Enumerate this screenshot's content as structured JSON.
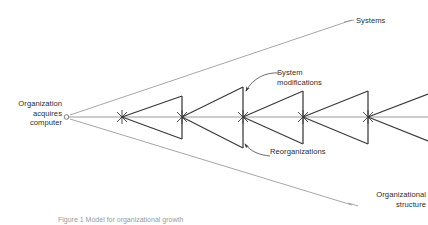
{
  "figure": {
    "domain_type": "diagram",
    "diagram_kind": "fan-of-triangles growth diagram",
    "background_color": "#ffffff",
    "line_color": "#3a3a3a",
    "thin_line_color": "#8c8c8c",
    "text_color": "#2d2d2d",
    "caption": "Figure 1 Model for organizational growth",
    "labels": {
      "origin": "Organization\nacquires\ncomputer",
      "systems": "Systems",
      "organizational_structure": "Organizational\nstructure",
      "system_modifications": "System\nmodifications",
      "reorganizations": "Reorganizations"
    },
    "geometry": {
      "origin_point": {
        "x": 66,
        "y": 117
      },
      "origin_marker": "open-circle",
      "axis_y": 117,
      "axis_start_x": 66,
      "axis_end_x": 428,
      "upper_envelope_end": {
        "x": 352,
        "y": 20
      },
      "lower_envelope_end": {
        "x": 352,
        "y": 205
      },
      "node_marker": "x-star",
      "node_x_positions": [
        122,
        182,
        243,
        303,
        368
      ],
      "triangles": [
        {
          "apex_x": 122,
          "bar_x": 182,
          "bar_top_y": 96,
          "bar_bottom_y": 139
        },
        {
          "apex_x": 182,
          "bar_x": 243,
          "bar_top_y": 87,
          "bar_bottom_y": 148
        },
        {
          "apex_x": 243,
          "bar_x": 303,
          "bar_top_y": 91,
          "bar_bottom_y": 144
        },
        {
          "apex_x": 303,
          "bar_x": 368,
          "bar_top_y": 91,
          "bar_bottom_y": 144
        }
      ],
      "trailing_rays": [
        {
          "from_x": 368,
          "from_y": 117,
          "to_x": 428,
          "to_y": 96
        },
        {
          "from_x": 368,
          "from_y": 117,
          "to_x": 428,
          "to_y": 139
        }
      ],
      "callouts": [
        {
          "name": "system-modifications",
          "arrow_tip": {
            "x": 245,
            "y": 92
          },
          "arrow_tail": {
            "x": 276,
            "y": 74
          }
        },
        {
          "name": "reorganizations",
          "arrow_tip": {
            "x": 245,
            "y": 145
          },
          "arrow_tail": {
            "x": 268,
            "y": 156
          }
        }
      ]
    }
  }
}
